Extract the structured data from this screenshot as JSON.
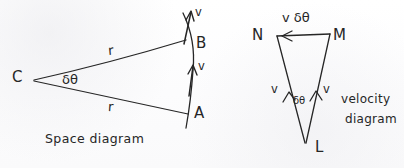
{
  "figure": {
    "ink_color": "#262626",
    "paper_color": "#fdfdfd",
    "width": 404,
    "height": 168
  },
  "space_diagram": {
    "caption": "Space diagram",
    "center_label": "C",
    "point_top_label": "B",
    "point_bottom_label": "A",
    "radius_label_top": "r",
    "radius_label_bottom": "r",
    "angle_label": "δθ",
    "velocity_label_top": "v",
    "velocity_label_bottom": "v"
  },
  "velocity_diagram": {
    "caption_line1": "velocity",
    "caption_line2": "diagram",
    "apex_label": "L",
    "top_left_label": "N",
    "top_right_label": "M",
    "top_edge_label": "v δθ",
    "leg_left_label": "v",
    "leg_right_label": "v",
    "angle_label": "δθ"
  }
}
